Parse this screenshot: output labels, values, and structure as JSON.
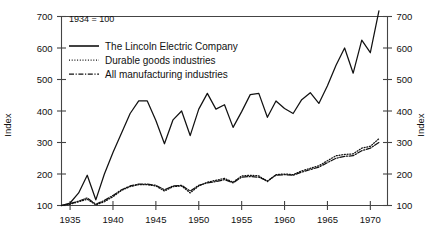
{
  "chart_data": {
    "type": "line",
    "title": "",
    "note": "1934 = 100",
    "xlabel": "",
    "ylabel": "Index",
    "ylabel_right": "Index",
    "xlim": [
      1934,
      1972
    ],
    "ylim": [
      100,
      700
    ],
    "yticks": [
      100,
      200,
      300,
      400,
      500,
      600,
      700
    ],
    "xticks": [
      1935,
      1940,
      1945,
      1950,
      1955,
      1960,
      1965,
      1970
    ],
    "ytick_labels": [
      "100",
      "200",
      "300",
      "400",
      "500",
      "600",
      "700"
    ],
    "xtick_labels": [
      "1935",
      "1940",
      "1945",
      "1950",
      "1955",
      "1960",
      "1965",
      "1970"
    ],
    "grid": false,
    "legend_position": "top-left",
    "x": [
      1934,
      1935,
      1936,
      1937,
      1938,
      1939,
      1940,
      1941,
      1942,
      1943,
      1944,
      1945,
      1946,
      1947,
      1948,
      1949,
      1950,
      1951,
      1952,
      1953,
      1954,
      1955,
      1956,
      1957,
      1958,
      1959,
      1960,
      1961,
      1962,
      1963,
      1964,
      1965,
      1966,
      1967,
      1968,
      1969,
      1970,
      1971
    ],
    "series": [
      {
        "name": "The Lincoln Electric Company",
        "style": "solid",
        "color": "#111111",
        "values": [
          100,
          108,
          140,
          196,
          118,
          200,
          268,
          330,
          392,
          432,
          432,
          370,
          296,
          372,
          400,
          322,
          406,
          456,
          406,
          420,
          348,
          398,
          452,
          456,
          380,
          432,
          408,
          392,
          436,
          458,
          424,
          480,
          545,
          600,
          520,
          625,
          585,
          718
        ]
      },
      {
        "name": "Durable goods industries",
        "style": "dotted",
        "color": "#111111",
        "values": [
          100,
          104,
          112,
          120,
          102,
          112,
          128,
          148,
          160,
          166,
          166,
          162,
          146,
          160,
          162,
          140,
          162,
          174,
          180,
          186,
          174,
          194,
          196,
          194,
          176,
          198,
          200,
          198,
          210,
          218,
          226,
          242,
          258,
          262,
          264,
          282,
          288,
          312
        ]
      },
      {
        "name": "All manufacturing industries",
        "style": "dashdot",
        "color": "#111111",
        "values": [
          100,
          106,
          114,
          124,
          104,
          116,
          132,
          150,
          162,
          168,
          168,
          164,
          150,
          162,
          164,
          146,
          164,
          172,
          176,
          182,
          172,
          190,
          192,
          190,
          178,
          196,
          198,
          196,
          206,
          214,
          222,
          236,
          250,
          256,
          258,
          274,
          282,
          300
        ]
      }
    ]
  },
  "legend": {
    "items": [
      {
        "label": "The Lincoln Electric Company",
        "style": "solid"
      },
      {
        "label": "Durable goods industries",
        "style": "dotted"
      },
      {
        "label": "All manufacturing industries",
        "style": "dashdot"
      }
    ]
  }
}
